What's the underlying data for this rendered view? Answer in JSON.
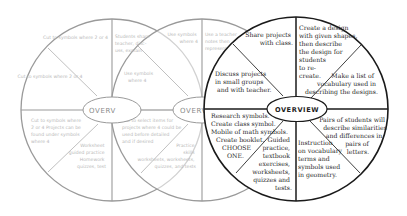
{
  "diagram": {
    "type": "three overlapping sectioned circles (learning wheel / menu)",
    "colors": {
      "background": "#ffffff",
      "faint_circle_stroke": "#9a9a9a",
      "faint_text": "#b8b8b8",
      "active_circle_stroke": "#1a1a1a",
      "active_text": "#2a2a2a"
    },
    "circles": [
      {
        "id": "left",
        "state": "faded",
        "center_label": "OVERV",
        "sections": [
          {
            "position": "top-left-upper",
            "text": "Cut to symbols where 2 or 4"
          },
          {
            "position": "top-left-lower",
            "text": "Cut to symbols where 2 or 4"
          },
          {
            "position": "bottom-left-upper",
            "text": "Cut to symbols where 2 or 4 Projects can be found under symbols where 4"
          },
          {
            "position": "bottom-left-lower",
            "text": "Worksheet guided practice Homework quizzes, test"
          }
        ]
      },
      {
        "id": "middle",
        "state": "faded",
        "center_label": "OVERV",
        "sections": [
          {
            "position": "top-left-upper",
            "text": "Use symbols where 4"
          },
          {
            "position": "top-left-lower",
            "text": "Use symbols where 4"
          },
          {
            "position": "top-overlap",
            "text": "Students share teacher, discuss, explain"
          },
          {
            "position": "bottom-left-upper",
            "text": "Cut to select items for projects where 4 could be used before detailed and if desired"
          },
          {
            "position": "bottom-left-lower",
            "text": "Practice skills worksheets, worksheets, quizzes, and tests"
          }
        ]
      },
      {
        "id": "right",
        "state": "active",
        "center_label": "OVERVIEW",
        "sections": [
          {
            "position": "top-left-upper",
            "lines": [
              "Share projects",
              "with class."
            ]
          },
          {
            "position": "top-left-lower",
            "lines": [
              "Discuss projects",
              "in small groups",
              "and with teacher."
            ]
          },
          {
            "position": "top-right-upper",
            "lines": [
              "Create a design",
              "with given shapes,",
              "then describe",
              "the design for",
              "students",
              "to re-",
              "create."
            ]
          },
          {
            "position": "top-right-lower",
            "lines": [
              "Make a list of",
              "vocabulary used in",
              "describing the designs."
            ]
          },
          {
            "position": "bottom-left-upper",
            "lines": [
              "Research symbols.",
              "Create class symbol.",
              "Mobile of math symbols.",
              "Create booklet.",
              "CHOOSE",
              "ONE."
            ]
          },
          {
            "position": "bottom-left-lower",
            "lines": [
              "Guided",
              "practice,",
              "textbook",
              "exercises,",
              "worksheets,",
              "quizzes and",
              "tests."
            ]
          },
          {
            "position": "bottom-right-lower",
            "lines": [
              "Instruction",
              "on vocabulary",
              "terms and",
              "symbols used",
              "in geometry."
            ]
          },
          {
            "position": "bottom-right-upper",
            "lines": [
              "Pairs of students will",
              "describe similarities",
              "and differences in",
              "pairs of",
              "letters."
            ]
          }
        ]
      }
    ]
  }
}
